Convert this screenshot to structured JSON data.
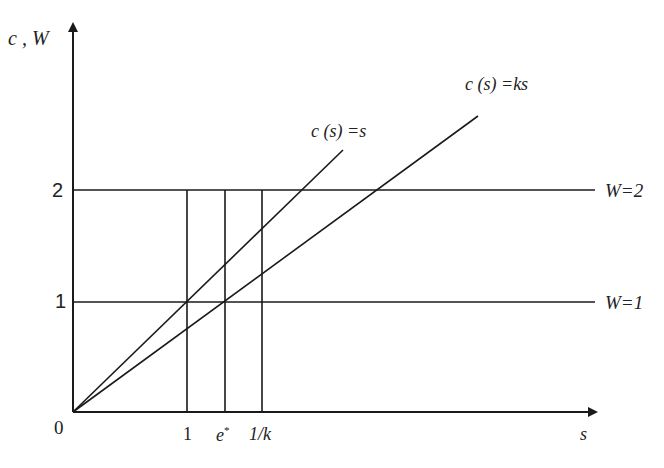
{
  "figure": {
    "y_axis_label": "c , W",
    "x_axis_label": "s",
    "origin_label": "0",
    "y_ticks": [
      {
        "label": "2",
        "value": 2
      },
      {
        "label": "1",
        "value": 1
      }
    ],
    "x_ticks": [
      {
        "label": "1",
        "value": 1
      },
      {
        "label": "e*",
        "value": "e*"
      },
      {
        "label": "1/k",
        "value": "1/k"
      }
    ],
    "lines": [
      {
        "label": "c (s) =s",
        "equation": "c(s)=s"
      },
      {
        "label": "c (s) =ks",
        "equation": "c(s)=ks"
      },
      {
        "label": "W=2",
        "equation": "W=2"
      },
      {
        "label": "W=1",
        "equation": "W=1"
      }
    ],
    "colors": {
      "line": "#1a1a1a",
      "background": "#ffffff"
    }
  },
  "labels": {
    "y_axis": "c , W",
    "x_axis": "s",
    "origin": "0",
    "ytick_2": "2",
    "ytick_1": "1",
    "xtick_1": "1",
    "xtick_e": "e",
    "xtick_e_sup": "*",
    "xtick_1k": "1/k",
    "line_cs_s": "c (s) =s",
    "line_cs_ks": "c (s) =ks",
    "line_w2": "W=2",
    "line_w1": "W=1"
  }
}
